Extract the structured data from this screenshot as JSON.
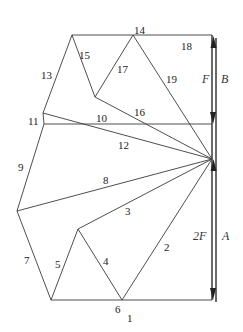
{
  "diagram": {
    "member_labels": {
      "m1": "1",
      "m2": "2",
      "m3": "3",
      "m4": "4",
      "m5": "5",
      "m6": "6",
      "m7": "7",
      "m8": "8",
      "m9": "9",
      "m10": "10",
      "m11": "11",
      "m12": "12",
      "m13": "13",
      "m14": "14",
      "m15": "15",
      "m16": "16",
      "m17": "17",
      "m18": "18",
      "m19": "19"
    },
    "force_labels": {
      "upper_force": "F",
      "upper_reaction": "B",
      "lower_force": "2F",
      "lower_reaction": "A"
    },
    "colors": {
      "line": "#3a3a3a",
      "arrow": "#222222",
      "text": "#222222"
    }
  }
}
